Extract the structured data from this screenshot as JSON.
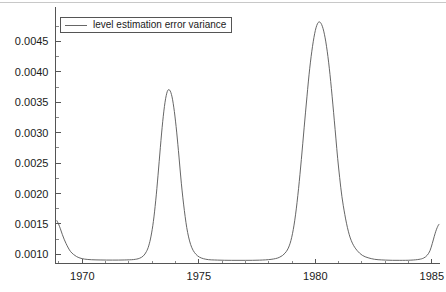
{
  "chart_data": {
    "type": "line",
    "title": "",
    "xlabel": "",
    "ylabel": "",
    "grid": false,
    "legend_position": "top-left",
    "background_color": "#ffffff",
    "line_color": "#555555",
    "xlim": [
      1968.85,
      1985.35
    ],
    "ylim": [
      0.00085,
      0.00505
    ],
    "x_tick_labels": [
      "1970",
      "1975",
      "1980",
      "1985"
    ],
    "x_tick_values": [
      1970,
      1975,
      1980,
      1985
    ],
    "x_minor_tick_values": [
      1969,
      1971,
      1972,
      1973,
      1974,
      1976,
      1977,
      1978,
      1979,
      1981,
      1982,
      1983,
      1984
    ],
    "y_tick_labels": [
      "0.0010",
      "0.0015",
      "0.0020",
      "0.0025",
      "0.0030",
      "0.0035",
      "0.0040",
      "0.0045"
    ],
    "y_tick_values": [
      0.001,
      0.0015,
      0.002,
      0.0025,
      0.003,
      0.0035,
      0.004,
      0.0045
    ],
    "y_minor_tick_values": [
      0.00125,
      0.00175,
      0.00225,
      0.00275,
      0.00325,
      0.00375,
      0.00425,
      0.00475
    ],
    "series": [
      {
        "name": "level estimation error variance",
        "peaks": [
          {
            "x": 1973.5,
            "y": 0.0037
          },
          {
            "x": 1979.8,
            "y": 0.00488
          }
        ],
        "baseline": 0.00092,
        "x": [
          1968.9,
          1968.98,
          1969.06,
          1969.14,
          1969.22,
          1969.3,
          1969.4,
          1969.5,
          1969.62,
          1969.75,
          1969.9,
          1970.1,
          1970.4,
          1970.8,
          1971.3,
          1971.8,
          1972.2,
          1972.45,
          1972.62,
          1972.75,
          1972.85,
          1972.95,
          1973.05,
          1973.15,
          1973.25,
          1973.35,
          1973.45,
          1973.55,
          1973.65,
          1973.75,
          1973.85,
          1973.95,
          1974.05,
          1974.15,
          1974.25,
          1974.38,
          1974.52,
          1974.7,
          1974.95,
          1975.3,
          1975.8,
          1976.4,
          1977.0,
          1977.6,
          1978.1,
          1978.45,
          1978.7,
          1978.88,
          1979.02,
          1979.15,
          1979.28,
          1979.4,
          1979.52,
          1979.64,
          1979.76,
          1979.88,
          1980.0,
          1980.12,
          1980.24,
          1980.36,
          1980.48,
          1980.6,
          1980.72,
          1980.85,
          1981.0,
          1981.2,
          1981.5,
          1981.9,
          1982.4,
          1983.0,
          1983.6,
          1984.1,
          1984.45,
          1984.65,
          1984.8,
          1984.92,
          1985.02,
          1985.1,
          1985.17,
          1985.23,
          1985.28,
          1985.32
        ],
        "y": [
          0.00156,
          0.0015,
          0.00142,
          0.00133,
          0.00125,
          0.00118,
          0.001105,
          0.001045,
          0.001,
          0.000965,
          0.00094,
          0.000922,
          0.000912,
          0.000908,
          0.000906,
          0.000908,
          0.000915,
          0.000935,
          0.000975,
          0.001045,
          0.00114,
          0.0013,
          0.00154,
          0.00188,
          0.0023,
          0.00276,
          0.00318,
          0.0035,
          0.00368,
          0.0037,
          0.00359,
          0.00335,
          0.00301,
          0.0026,
          0.00217,
          0.00172,
          0.00136,
          0.00111,
          0.000975,
          0.00092,
          0.000906,
          0.000902,
          0.000902,
          0.000905,
          0.000918,
          0.00095,
          0.00102,
          0.00114,
          0.00134,
          0.00165,
          0.00208,
          0.00256,
          0.00308,
          0.00359,
          0.00406,
          0.00442,
          0.00468,
          0.00481,
          0.0048,
          0.00467,
          0.00442,
          0.00406,
          0.0036,
          0.00305,
          0.00242,
          0.0018,
          0.00127,
          0.00102,
          0.00093,
          0.000906,
          0.000902,
          0.000905,
          0.000918,
          0.00094,
          0.000985,
          0.00106,
          0.00118,
          0.00129,
          0.00138,
          0.00144,
          0.00148,
          0.0015
        ]
      }
    ]
  },
  "legend": {
    "entries": [
      {
        "label": "level estimation error variance",
        "color": "#666666"
      }
    ]
  }
}
